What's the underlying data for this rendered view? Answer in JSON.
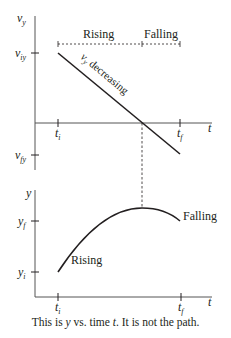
{
  "top_graph": {
    "y_axis_label": "v",
    "y_axis_sub": "y",
    "x_axis_label": "t",
    "y_ticks": [
      {
        "main": "v",
        "sub": "iy"
      },
      {
        "main": "v",
        "sub": "fy"
      }
    ],
    "x_ticks": [
      {
        "main": "t",
        "sub": "i"
      },
      {
        "main": "t",
        "sub": "f"
      }
    ],
    "phase_labels": {
      "rising": "Rising",
      "falling": "Falling"
    },
    "line_label_main": "v",
    "line_label_sub": "y",
    "line_label_rest": " decreasing"
  },
  "bottom_graph": {
    "y_axis_label": "y",
    "x_axis_label": "t",
    "y_ticks": [
      {
        "main": "y",
        "sub": "f"
      },
      {
        "main": "y",
        "sub": "i"
      }
    ],
    "x_ticks": [
      {
        "main": "t",
        "sub": "i"
      },
      {
        "main": "t",
        "sub": "f"
      }
    ],
    "curve_labels": {
      "rising": "Rising",
      "falling": "Falling"
    }
  },
  "caption": {
    "part1": "This is ",
    "var1": "y",
    "part2": " vs. time ",
    "var2": "t",
    "part3": ". It is not the path."
  },
  "colors": {
    "line": "#231f20",
    "axis": "#555555"
  }
}
